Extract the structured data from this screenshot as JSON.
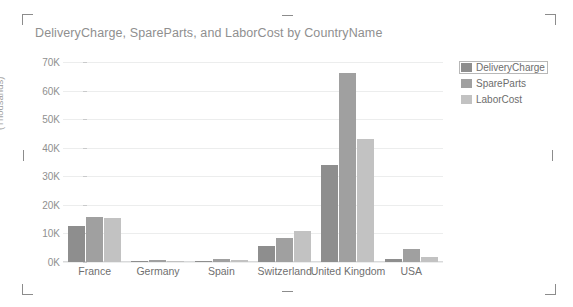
{
  "visual": {
    "title": "DeliveryCharge, SpareParts, and LaborCost by CountryName",
    "y_axis_title": "(Thousands)"
  },
  "legend": {
    "position": "right",
    "items": [
      {
        "label": "DeliveryCharge",
        "color": "#8e8e8e",
        "selected": true
      },
      {
        "label": "SpareParts",
        "color": "#a0a0a0",
        "selected": false
      },
      {
        "label": "LaborCost",
        "color": "#c2c2c2",
        "selected": false
      }
    ]
  },
  "handles": {
    "top_left": "resize-handle",
    "top_center": "resize-handle",
    "top_right": "resize-handle",
    "left_center": "resize-handle",
    "right_center": "resize-handle",
    "bottom_left": "resize-handle",
    "bottom_center": "resize-handle",
    "bottom_right": "resize-handle"
  },
  "chart_data": {
    "type": "bar",
    "title": "DeliveryCharge, SpareParts, and LaborCost by CountryName",
    "xlabel": "",
    "ylabel": "(Thousands)",
    "categories": [
      "France",
      "Germany",
      "Spain",
      "Switzerland",
      "United Kingdom",
      "USA"
    ],
    "series": [
      {
        "name": "DeliveryCharge",
        "color": "#8e8e8e",
        "values": [
          12.6,
          0.4,
          0.3,
          5.5,
          33.8,
          1.0
        ]
      },
      {
        "name": "SpareParts",
        "color": "#a0a0a0",
        "values": [
          15.9,
          0.7,
          0.9,
          8.4,
          66.3,
          4.5
        ]
      },
      {
        "name": "LaborCost",
        "color": "#c2c2c2",
        "values": [
          15.5,
          0.4,
          0.6,
          10.8,
          42.9,
          1.8
        ]
      }
    ],
    "ylim": [
      0,
      70
    ],
    "ytick_labels": [
      "0K",
      "10K",
      "20K",
      "30K",
      "40K",
      "50K",
      "60K",
      "70K"
    ],
    "ytick_values": [
      0,
      10,
      20,
      30,
      40,
      50,
      60,
      70
    ],
    "grid": true,
    "legend_position": "right",
    "units": "Thousands"
  }
}
